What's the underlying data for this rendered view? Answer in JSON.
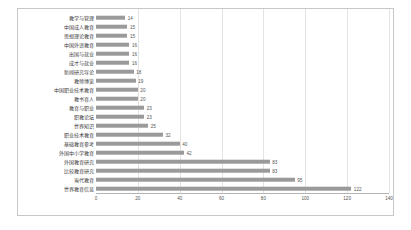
{
  "chart_data": {
    "type": "bar",
    "orientation": "horizontal",
    "title": "",
    "xlabel": "",
    "ylabel": "",
    "xlim": [
      0,
      140
    ],
    "xticks": [
      0,
      20,
      40,
      60,
      80,
      100,
      120,
      140
    ],
    "grid": true,
    "legend": false,
    "bar_color": "#9a9a9a",
    "categories": [
      "教学与管理",
      "中国成人教育",
      "思想理论教育",
      "中国外语教育",
      "出国与就业",
      "成才与就业",
      "新闻研究导论",
      "教师博览",
      "中国职业技术教育",
      "教书育人",
      "教育与职业",
      "职教论坛",
      "世界知识",
      "职业技术教育",
      "基础教育参考",
      "外国中小学教育",
      "外国教育研究",
      "比较教育研究",
      "当代教育",
      "世界教育信息"
    ],
    "values": [
      14,
      15,
      15,
      16,
      16,
      16,
      18,
      19,
      20,
      20,
      23,
      23,
      25,
      32,
      40,
      42,
      83,
      83,
      95,
      122
    ]
  }
}
